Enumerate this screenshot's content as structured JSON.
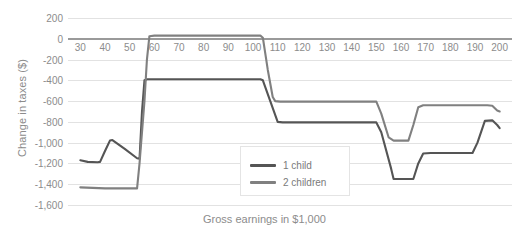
{
  "chart_data": {
    "type": "line",
    "title": "",
    "xlabel": "Gross earnings in $1,000",
    "ylabel": "Change in taxes ($)",
    "xlim": [
      25,
      205
    ],
    "ylim": [
      -1600,
      200
    ],
    "grid": true,
    "legend_position": "center-left-inside",
    "x_ticks": [
      30,
      40,
      50,
      60,
      70,
      80,
      90,
      100,
      110,
      120,
      130,
      140,
      150,
      160,
      170,
      180,
      190,
      200
    ],
    "x_tick_labels": [
      "30",
      "40",
      "50",
      "60",
      "70",
      "80",
      "90",
      "100",
      "110",
      "120",
      "130",
      "140",
      "150",
      "160",
      "170",
      "180",
      "190",
      "200"
    ],
    "y_ticks": [
      200,
      0,
      -200,
      -400,
      -600,
      -800,
      -1000,
      -1200,
      -1400,
      -1600
    ],
    "y_tick_labels": [
      "200",
      "0",
      "-200",
      "-400",
      "-600",
      "-800",
      "-1,000",
      "-1,200",
      "-1,400",
      "-1,600"
    ],
    "series": [
      {
        "name": "1 child",
        "color": "#555555",
        "points": [
          [
            30,
            -1170
          ],
          [
            33,
            -1185
          ],
          [
            37,
            -1188
          ],
          [
            38,
            -1185
          ],
          [
            40,
            -1080
          ],
          [
            42,
            -980
          ],
          [
            43,
            -975
          ],
          [
            48,
            -1060
          ],
          [
            53,
            -1150
          ],
          [
            54,
            -1155
          ],
          [
            55,
            -700
          ],
          [
            56,
            -400
          ],
          [
            57,
            -390
          ],
          [
            103,
            -390
          ],
          [
            104,
            -400
          ],
          [
            107,
            -600
          ],
          [
            110,
            -800
          ],
          [
            112,
            -805
          ],
          [
            150,
            -805
          ],
          [
            152,
            -900
          ],
          [
            156,
            -1250
          ],
          [
            157,
            -1350
          ],
          [
            165,
            -1350
          ],
          [
            167,
            -1200
          ],
          [
            169,
            -1105
          ],
          [
            172,
            -1100
          ],
          [
            189,
            -1100
          ],
          [
            191,
            -1000
          ],
          [
            194,
            -790
          ],
          [
            197,
            -785
          ],
          [
            199,
            -830
          ],
          [
            200,
            -860
          ]
        ]
      },
      {
        "name": "2 children",
        "color": "#808080",
        "points": [
          [
            30,
            -1430
          ],
          [
            40,
            -1440
          ],
          [
            50,
            -1440
          ],
          [
            53,
            -1440
          ],
          [
            54,
            -1200
          ],
          [
            56,
            -600
          ],
          [
            57,
            -200
          ],
          [
            58,
            25
          ],
          [
            60,
            30
          ],
          [
            103,
            30
          ],
          [
            104,
            10
          ],
          [
            106,
            -300
          ],
          [
            108,
            -560
          ],
          [
            109,
            -600
          ],
          [
            111,
            -605
          ],
          [
            150,
            -605
          ],
          [
            152,
            -720
          ],
          [
            155,
            -950
          ],
          [
            157,
            -980
          ],
          [
            163,
            -980
          ],
          [
            165,
            -830
          ],
          [
            167,
            -660
          ],
          [
            169,
            -640
          ],
          [
            195,
            -640
          ],
          [
            197,
            -645
          ],
          [
            199,
            -690
          ],
          [
            200,
            -700
          ]
        ]
      }
    ]
  },
  "legend": {
    "items": [
      {
        "label": "1 child",
        "color": "#555555"
      },
      {
        "label": "2 children",
        "color": "#808080"
      }
    ]
  }
}
